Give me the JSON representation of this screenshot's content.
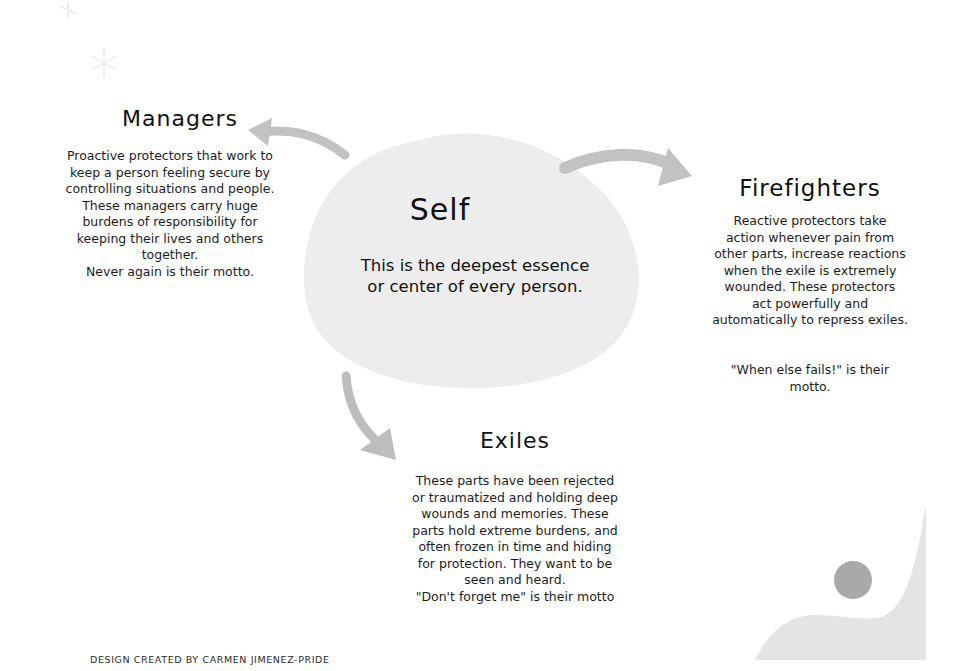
{
  "diagram": {
    "self": {
      "title": "Self",
      "description": "This is the deepest essence\nor center of every person."
    },
    "managers": {
      "title": "Managers",
      "description": "Proactive protectors that work to\nkeep a person feeling secure by\ncontrolling situations and people.\nThese managers carry huge\nburdens of responsibility for\nkeeping their lives and others\ntogether.\nNever again is their motto."
    },
    "firefighters": {
      "title": "Firefighters",
      "description": "Reactive protectors take\naction whenever pain from\nother parts, increase reactions\nwhen the exile is extremely\nwounded. These protectors\nact powerfully and\nautomatically to repress exiles.",
      "motto": "\"When else fails!\" is their\nmotto."
    },
    "exiles": {
      "title": "Exiles",
      "description": "These parts have been rejected\nor traumatized and holding deep\nwounds and memories. These\nparts hold extreme burdens, and\noften frozen in time and hiding\nfor protection. They want to be\nseen and heard.\n\"Don't forget me\" is their motto"
    },
    "edges": [
      {
        "from": "Self",
        "to": "Managers"
      },
      {
        "from": "Self",
        "to": "Firefighters"
      },
      {
        "from": "Self",
        "to": "Exiles"
      }
    ]
  },
  "footer": {
    "credit": "DESIGN CREATED BY CARMEN JIMENEZ-PRIDE"
  },
  "colors": {
    "blob": "#ececec",
    "arrow": "#bdbdbd",
    "corner_shape": "#e4e4e4",
    "circle": "#a9a9a9",
    "text": "#1c1c1c"
  }
}
